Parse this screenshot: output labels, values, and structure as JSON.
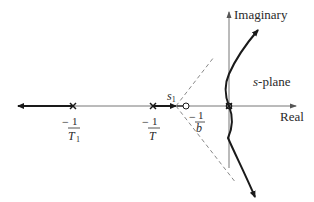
{
  "diagram": {
    "type": "root-locus",
    "plane_label": "s-plane",
    "plane_label_italic": "s",
    "plane_label_rest": "-plane",
    "axes": {
      "real_label": "Real",
      "imag_label": "Imaginary"
    },
    "poles": [
      {
        "id": "p1",
        "label_num": "1",
        "label_den": "T",
        "label_den_sub": "1",
        "sign": "−"
      },
      {
        "id": "p2",
        "label_num": "1",
        "label_den": "T",
        "label_den_sub": "",
        "sign": "−"
      },
      {
        "id": "p0",
        "label": "double pole at origin"
      }
    ],
    "zeros": [
      {
        "id": "z1",
        "label_num": "1",
        "label_den": "b",
        "sign": "−"
      }
    ],
    "breakaway": {
      "label": "s",
      "sub": "1"
    },
    "colors": {
      "line": "#1a1a1a",
      "axis": "#777777",
      "dashed": "#888888"
    }
  }
}
